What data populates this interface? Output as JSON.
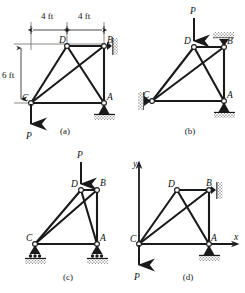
{
  "figure": {
    "panels": [
      {
        "id": "a",
        "caption": "(a)",
        "nodes": [
          {
            "label": "D",
            "x": 4,
            "y": 6
          },
          {
            "label": "B",
            "x": 8,
            "y": 6
          },
          {
            "label": "C",
            "x": 0,
            "y": 0
          },
          {
            "label": "A",
            "x": 8,
            "y": 0
          }
        ],
        "members": [
          "C-D",
          "C-B",
          "C-A",
          "D-A",
          "D-B",
          "B-A"
        ],
        "dimensions": [
          {
            "label": "4 ft",
            "from": "C-top",
            "to": "D",
            "orientation": "horizontal"
          },
          {
            "label": "4 ft",
            "from": "D",
            "to": "B",
            "orientation": "horizontal"
          },
          {
            "label": "6 ft",
            "from": "C",
            "to": "D-level",
            "orientation": "vertical"
          }
        ],
        "load": {
          "label": "P",
          "at": "C",
          "direction": "down"
        },
        "supports": [
          {
            "at": "B",
            "type": "roller-vertical-wall"
          },
          {
            "at": "A",
            "type": "pin-ground"
          }
        ]
      },
      {
        "id": "b",
        "caption": "(b)",
        "nodes": [
          {
            "label": "D",
            "x": 4,
            "y": 6
          },
          {
            "label": "B",
            "x": 8,
            "y": 6
          },
          {
            "label": "C",
            "x": 0,
            "y": 0
          },
          {
            "label": "A",
            "x": 8,
            "y": 0
          }
        ],
        "members": [
          "C-D",
          "C-B",
          "C-A",
          "D-A",
          "D-B",
          "B-A"
        ],
        "dimensions": [],
        "load": {
          "label": "P",
          "at": "D",
          "direction": "down"
        },
        "supports": [
          {
            "at": "C",
            "type": "pin-vertical-wall"
          },
          {
            "at": "B",
            "type": "roller-ceiling"
          },
          {
            "at": "A",
            "type": "pin-ground"
          }
        ]
      },
      {
        "id": "c",
        "caption": "(c)",
        "nodes": [
          {
            "label": "D",
            "x": 4,
            "y": 6
          },
          {
            "label": "B",
            "x": 8,
            "y": 6
          },
          {
            "label": "C",
            "x": 0,
            "y": 0
          },
          {
            "label": "A",
            "x": 8,
            "y": 0
          }
        ],
        "members": [
          "C-D",
          "C-B",
          "C-A",
          "D-A",
          "D-B",
          "B-A"
        ],
        "dimensions": [],
        "load": {
          "label": "P",
          "at": "D",
          "direction": "down"
        },
        "supports": [
          {
            "at": "C",
            "type": "rocker-ground"
          },
          {
            "at": "A",
            "type": "rocker-ground"
          }
        ]
      },
      {
        "id": "d",
        "caption": "(d)",
        "nodes": [
          {
            "label": "D",
            "x": 4,
            "y": 6
          },
          {
            "label": "B",
            "x": 8,
            "y": 6
          },
          {
            "label": "C",
            "x": 0,
            "y": 0
          },
          {
            "label": "A",
            "x": 8,
            "y": 0
          }
        ],
        "members": [
          "C-D",
          "C-B",
          "C-A",
          "D-A",
          "D-B",
          "B-A"
        ],
        "dimensions": [],
        "load": {
          "label": "P",
          "at": "C",
          "direction": "down"
        },
        "axes": [
          {
            "label": "y",
            "direction": "up",
            "origin": "C"
          },
          {
            "label": "x",
            "direction": "right",
            "origin": "C"
          }
        ],
        "supports": [
          {
            "at": "B",
            "type": "roller-vertical-wall"
          },
          {
            "at": "A",
            "type": "pin-ground"
          }
        ]
      }
    ],
    "labels": {
      "node_d": "D",
      "node_b": "B",
      "node_c": "C",
      "node_a": "A",
      "load_p": "P",
      "axis_x": "x",
      "axis_y": "y",
      "dim_4ft": "4 ft",
      "dim_6ft": "6 ft"
    },
    "colors": {
      "member": "#1a1a1a",
      "background": "#ffffff",
      "hatch": "#8a8a8a",
      "text": "#111111"
    }
  }
}
